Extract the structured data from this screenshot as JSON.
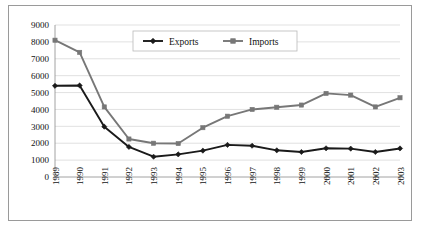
{
  "chart_data": {
    "type": "line",
    "title": "",
    "subtitle": "",
    "xlabel": "",
    "ylabel": "",
    "categories": [
      "1989",
      "1990",
      "1991",
      "1992",
      "1993",
      "1994",
      "1995",
      "1996",
      "1997",
      "1998",
      "1999",
      "2000",
      "2001",
      "2002",
      "2003"
    ],
    "series": [
      {
        "name": "Exports",
        "color": "#1a1a1a",
        "marker": "diamond",
        "values": [
          5400,
          5420,
          2980,
          1780,
          1200,
          1340,
          1560,
          1900,
          1850,
          1580,
          1480,
          1700,
          1680,
          1480,
          1690
        ]
      },
      {
        "name": "Imports",
        "color": "#777777",
        "marker": "square",
        "values": [
          8100,
          7380,
          4150,
          2250,
          2000,
          1980,
          2920,
          3600,
          4000,
          4130,
          4260,
          4950,
          4850,
          4150,
          4690
        ]
      }
    ],
    "ylim": [
      0,
      9000
    ],
    "yticks": [
      0,
      1000,
      2000,
      3000,
      4000,
      5000,
      6000,
      7000,
      8000,
      9000
    ],
    "ytick_labels": [
      "0",
      "1000",
      "2000",
      "3000",
      "4000",
      "5000",
      "6000",
      "7000",
      "8000",
      "9000"
    ],
    "grid": true,
    "grid_axis": "y",
    "legend": {
      "position": "top-center",
      "entries": [
        "Exports",
        "Imports"
      ]
    },
    "colors": {
      "exports": "#1a1a1a",
      "imports": "#777777",
      "grid": "#d4d4d4",
      "axis": "#8c8c8c",
      "border": "#9a9a9a",
      "background": "#ffffff"
    }
  }
}
